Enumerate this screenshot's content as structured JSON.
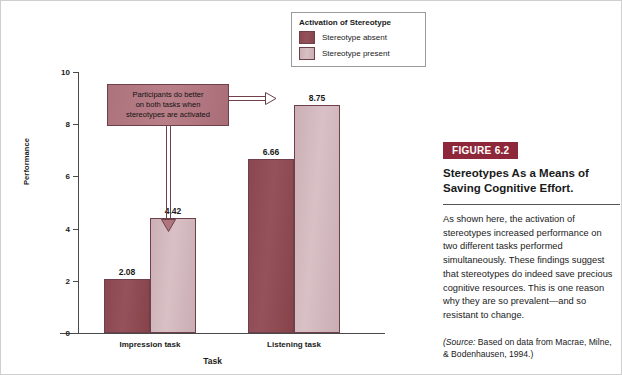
{
  "chart_data": {
    "type": "bar",
    "title": "",
    "xlabel": "Task",
    "ylabel": "Performance",
    "categories": [
      "Impression task",
      "Listening task"
    ],
    "series": [
      {
        "name": "Stereotype absent",
        "values": [
          2.08,
          6.66
        ],
        "color": "#8d4a53"
      },
      {
        "name": "Stereotype present",
        "values": [
          4.42,
          8.75
        ],
        "color": "#d4b8bd"
      }
    ],
    "ylim": [
      0,
      10
    ],
    "yticks": [
      0,
      2,
      4,
      6,
      8,
      10
    ],
    "grid": false,
    "legend_position": "top-right",
    "value_labels": [
      "2.08",
      "4.42",
      "6.66",
      "8.75"
    ],
    "annotations": [
      {
        "text": "Participants do better on both tasks when stereotypes are activated",
        "points_to": [
          "Stereotype present / Listening task (8.75)",
          "Stereotype present / Impression task (4.42)"
        ]
      }
    ]
  },
  "legend": {
    "title": "Activation of Stereotype",
    "items": [
      {
        "label": "Stereotype absent",
        "swatch": "dark"
      },
      {
        "label": "Stereotype present",
        "swatch": "light"
      }
    ]
  },
  "axes": {
    "ylabel": "Performance",
    "xlabel": "Task",
    "ytick_labels": [
      "0",
      "2",
      "4",
      "6",
      "8",
      "10"
    ],
    "group_labels": [
      "Impression task",
      "Listening task"
    ]
  },
  "bars": [
    {
      "value": 2.08,
      "label": "2.08",
      "group": "Impression task",
      "series": "Stereotype absent"
    },
    {
      "value": 4.42,
      "label": "4.42",
      "group": "Impression task",
      "series": "Stereotype present"
    },
    {
      "value": 6.66,
      "label": "6.66",
      "group": "Listening task",
      "series": "Stereotype absent"
    },
    {
      "value": 8.75,
      "label": "8.75",
      "group": "Listening task",
      "series": "Stereotype present"
    }
  ],
  "callout": {
    "line1": "Participants do better",
    "line2": "on both tasks when",
    "line3": "stereotypes are activated"
  },
  "panel": {
    "badge": "FIGURE 6.2",
    "title": "Stereotypes As a Means of Saving Cognitive Effort.",
    "body": "As shown here, the activation of stereotypes increased performance on two different tasks performed simultaneously. These findings suggest that stereotypes do indeed save precious cognitive resources. This is one reason why they are so prevalent—and so resistant to change.",
    "source_word": "(Source:",
    "source_rest": " Based on data from Macrae, Milne, & Bodenhausen, 1994.)"
  },
  "colors": {
    "bar_dark": "#8d4a53",
    "bar_light": "#d4b8bd",
    "bar_border": "#6e4049",
    "callout_bg": "#b27a83",
    "badge_bg": "#8e2739",
    "axis": "#4a4a4a"
  }
}
